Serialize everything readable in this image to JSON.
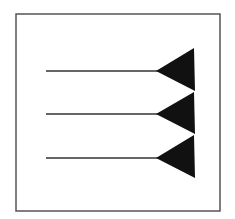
{
  "diagram": {
    "title": "",
    "frame": {
      "x": 16,
      "y": 14,
      "width": 204,
      "height": 197,
      "stroke": "#555555",
      "stroke_width": 1.5
    },
    "arrows": [
      {
        "line": {
          "x1": 46,
          "y1": 71,
          "x2": 158,
          "y2": 71
        },
        "head": [
          [
            156,
            71
          ],
          [
            194,
            48
          ],
          [
            195,
            91
          ]
        ]
      },
      {
        "line": {
          "x1": 46,
          "y1": 114,
          "x2": 158,
          "y2": 114
        },
        "head": [
          [
            156,
            114
          ],
          [
            194,
            92
          ],
          [
            195,
            134
          ]
        ]
      },
      {
        "line": {
          "x1": 46,
          "y1": 158,
          "x2": 158,
          "y2": 158
        },
        "head": [
          [
            156,
            158
          ],
          [
            194,
            135
          ],
          [
            195,
            178
          ]
        ]
      }
    ],
    "colors": {
      "line": "#333333",
      "head": "#111111",
      "background": "#ffffff"
    }
  }
}
